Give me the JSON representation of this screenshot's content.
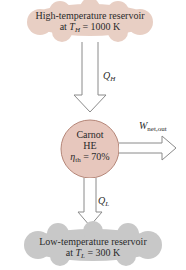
{
  "colors": {
    "hot_reservoir": "#e8cfc4",
    "cold_reservoir": "#c8c8c8",
    "engine": "#e7c7bd",
    "engine_stroke": "#b58678",
    "arrow_stroke": "#8a8a8a"
  },
  "hot_reservoir": {
    "line1": "High-temperature reservoir",
    "line2_prefix": "at ",
    "line2_symbol": "T",
    "line2_sub": "H",
    "line2_suffix": " = 1000 K"
  },
  "heat_in": {
    "symbol": "Q",
    "sub": "H"
  },
  "engine": {
    "line1": "Carnot",
    "line2": "HE",
    "eta_symbol": "η",
    "eta_sub": "th",
    "eta_value": " = 70%"
  },
  "work_out": {
    "symbol": "W",
    "sub": "net,out"
  },
  "heat_out": {
    "symbol": "Q",
    "sub": "L"
  },
  "cold_reservoir": {
    "line1": "Low-temperature reservoir",
    "line2_prefix": "at ",
    "line2_symbol": "T",
    "line2_sub": "L",
    "line2_suffix": " = 300 K"
  }
}
